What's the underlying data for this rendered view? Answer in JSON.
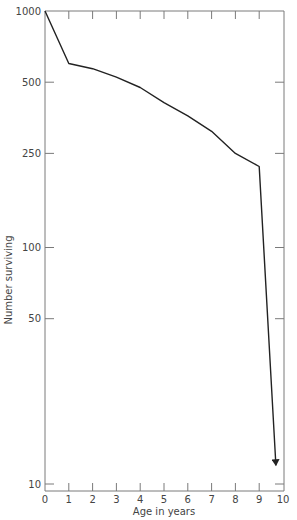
{
  "chart_data": {
    "type": "line",
    "title": "",
    "xlabel": "Age in years",
    "ylabel": "Number surviving",
    "yscale": "log",
    "xlim": [
      0,
      10
    ],
    "ylim": [
      10,
      1000
    ],
    "grid": false,
    "legend": null,
    "x_ticks": [
      "0",
      "1",
      "2",
      "3",
      "4",
      "5",
      "6",
      "7",
      "8",
      "9",
      "10"
    ],
    "y_ticks": [
      "1000",
      "500",
      "250",
      "100",
      "50",
      "10"
    ],
    "series": [
      {
        "name": "Survivorship",
        "x": [
          0,
          1,
          2,
          3,
          4,
          5,
          6,
          7,
          8,
          9,
          9.7
        ],
        "values": [
          1000,
          600,
          570,
          525,
          475,
          410,
          360,
          310,
          250,
          220,
          12
        ],
        "end_marker": "arrow"
      }
    ]
  }
}
